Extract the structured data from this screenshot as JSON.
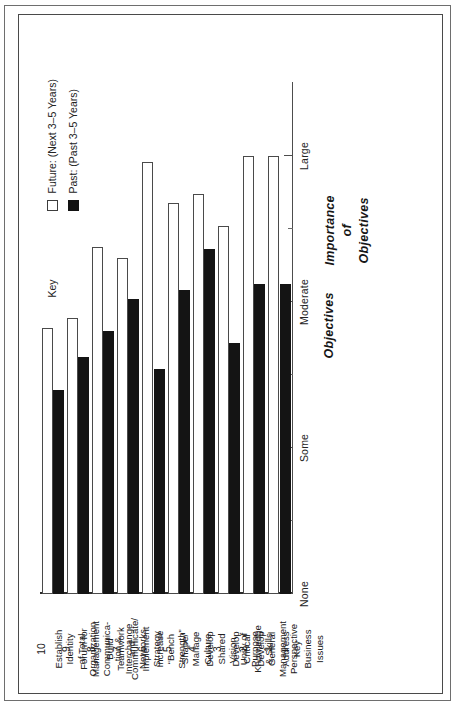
{
  "chart_data": {
    "type": "bar",
    "orientation": "horizontal-rotated",
    "title": "",
    "xlabel": "Objectives",
    "ylabel_lines": [
      "Importance",
      "of",
      "Objectives"
    ],
    "value_scale": {
      "labels": [
        "None",
        "Some",
        "Moderate",
        "Large"
      ],
      "values": [
        0,
        1,
        2,
        3
      ],
      "minor_ticks_between": 1,
      "grid": false
    },
    "legend": {
      "key_word": "Key",
      "position": "top-left",
      "entries": [
        {
          "label": "Future: (Next 3–5 Years)",
          "swatch": "future",
          "color": "#ffffff"
        },
        {
          "label": "Past: (Past 3–5 Years)",
          "swatch": "past",
          "color": "#121212"
        }
      ]
    },
    "categories": [
      {
        "num": "1",
        "label": "Address Key Business Issues",
        "lines": [
          "Address",
          "Key",
          "Business",
          "Issues"
        ]
      },
      {
        "num": "2",
        "label": "Develop General Management Perspective",
        "lines": [
          "Develop",
          "General",
          "Management",
          "Perspective"
        ]
      },
      {
        "num": "3",
        "label": "Develop Critical Knowledge & Skills",
        "lines": [
          "Develop",
          "Critical",
          "Knowledge",
          "& Skills"
        ]
      },
      {
        "num": "4",
        "label": "Develop Shared Vision, Unity of Purpose",
        "lines": [
          "Develop",
          "Shared",
          "Vision,",
          "Unity of",
          "Purpose"
        ]
      },
      {
        "num": "5",
        "label": "Shape/ Manage Culture",
        "lines": [
          "Shape/",
          "Manage",
          "Culture"
        ]
      },
      {
        "num": "6",
        "label": "Increase “Bench Strength”",
        "lines": [
          "Increase",
          "“Bench",
          "Strength”"
        ]
      },
      {
        "num": "7",
        "label": "Communicate/ Implement Strategy",
        "lines": [
          "Communicate/",
          "Implement",
          "Strategy"
        ]
      },
      {
        "num": "8",
        "label": "Build Teamwork and Networks",
        "lines": [
          "Build",
          "Teamwork",
          "and",
          "Networks"
        ]
      },
      {
        "num": "9",
        "label": "Forum for Management Communica-tion & Interchange",
        "lines": [
          "Forum for",
          "Management",
          "Communica-",
          "tion &",
          "Interchange"
        ]
      },
      {
        "num": "10",
        "label": "Establish Identity of Total Organization",
        "lines": [
          "Establish",
          "Identity",
          "of Total",
          "Organization"
        ]
      }
    ],
    "series": [
      {
        "name": "Future: (Next 3–5 Years)",
        "swatch": "future",
        "values": [
          3.0,
          3.0,
          2.52,
          2.74,
          2.68,
          2.96,
          2.3,
          2.38,
          1.89,
          1.82
        ]
      },
      {
        "name": "Past: (Past 3–5 Years)",
        "swatch": "past",
        "values": [
          2.12,
          2.12,
          1.72,
          2.36,
          2.08,
          1.54,
          2.02,
          1.8,
          1.62,
          1.4
        ]
      }
    ]
  }
}
